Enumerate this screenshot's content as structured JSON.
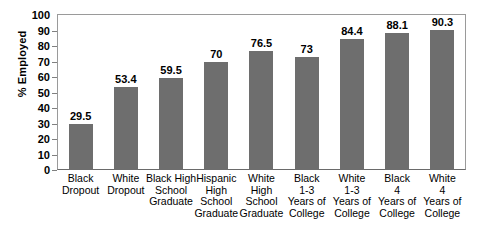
{
  "chart_data": {
    "type": "bar",
    "title": "",
    "xlabel": "",
    "ylabel": "% Employed",
    "ylim": [
      0,
      100
    ],
    "ytick_step": 10,
    "grid": false,
    "legend": "none",
    "bar_color": "#6e6e6e",
    "categories": [
      "Black Dropout",
      "White Dropout",
      "Black High School Graduate",
      "Hispanic High School Graduate",
      "White High School Graduate",
      "Black 1-3 Years of College",
      "White 1-3 Years of College",
      "Black 4 Years of College",
      "White 4 Years of College"
    ],
    "category_lines": [
      [
        "Black",
        "Dropout"
      ],
      [
        "White",
        "Dropout"
      ],
      [
        "Black High",
        "School",
        "Graduate"
      ],
      [
        "Hispanic",
        "High",
        "School",
        "Graduate"
      ],
      [
        "White",
        "High",
        "School",
        "Graduate"
      ],
      [
        "Black",
        "1-3",
        "Years of",
        "College"
      ],
      [
        "White",
        "1-3",
        "Years of",
        "College"
      ],
      [
        "Black",
        "4",
        "Years of",
        "College"
      ],
      [
        "White",
        "4",
        "Years of",
        "College"
      ]
    ],
    "values": [
      29.5,
      53.4,
      59.5,
      70,
      76.5,
      73,
      84.4,
      88.1,
      90.3
    ],
    "value_labels": [
      "29.5",
      "53.4",
      "59.5",
      "70",
      "76.5",
      "73",
      "84.4",
      "88.1",
      "90.3"
    ],
    "ytick_labels": [
      "100",
      "90",
      "80",
      "70",
      "60",
      "50",
      "40",
      "30",
      "20",
      "10",
      "0"
    ],
    "ytick_values": [
      100,
      90,
      80,
      70,
      60,
      50,
      40,
      30,
      20,
      10,
      0
    ]
  }
}
